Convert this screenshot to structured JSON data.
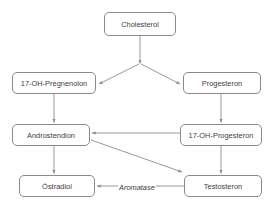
{
  "diagram": {
    "background_color": "#ffffff",
    "node_border_color": "#8a8a8a",
    "node_text_color": "#404040",
    "edge_color": "#8c8c8c",
    "nodes": [
      {
        "id": "cholesterol",
        "label": "Cholesterol",
        "x": 104,
        "y": 12,
        "w": 72,
        "h": 24
      },
      {
        "id": "pregnenolon_17oh",
        "label": "17-OH-Pregnenolon",
        "x": 12,
        "y": 72,
        "w": 84,
        "h": 22
      },
      {
        "id": "progesteron",
        "label": "Progesteron",
        "x": 183,
        "y": 72,
        "w": 78,
        "h": 22
      },
      {
        "id": "androstendion",
        "label": "Androstendion",
        "x": 12,
        "y": 124,
        "w": 78,
        "h": 22
      },
      {
        "id": "progesteron_17oh",
        "label": "17-OH-Progesteron",
        "x": 180,
        "y": 124,
        "w": 82,
        "h": 22
      },
      {
        "id": "oestradiol",
        "label": "Östradiol",
        "x": 19,
        "y": 175,
        "w": 76,
        "h": 22
      },
      {
        "id": "testosteron",
        "label": "Testosteron",
        "x": 184,
        "y": 175,
        "w": 78,
        "h": 22
      }
    ],
    "edges": [
      {
        "id": "cholesterol-junction",
        "from": "cholesterol",
        "to": "junction",
        "label": ""
      },
      {
        "id": "junction-to-pregnenolon",
        "from": "junction",
        "to": "pregnenolon_17oh",
        "label": ""
      },
      {
        "id": "junction-to-progesteron",
        "from": "junction",
        "to": "progesteron",
        "label": ""
      },
      {
        "id": "pregnenolon-to-androstendion",
        "from": "pregnenolon_17oh",
        "to": "androstendion",
        "label": ""
      },
      {
        "id": "progesteron-to-17oh-progesteron",
        "from": "progesteron",
        "to": "progesteron_17oh",
        "label": ""
      },
      {
        "id": "17oh-progesteron-to-androstendion",
        "from": "progesteron_17oh",
        "to": "androstendion",
        "label": ""
      },
      {
        "id": "17oh-progesteron-to-testosteron",
        "from": "progesteron_17oh",
        "to": "testosteron",
        "label": ""
      },
      {
        "id": "androstendion-to-oestradiol",
        "from": "androstendion",
        "to": "oestradiol",
        "label": ""
      },
      {
        "id": "androstendion-to-testosteron",
        "from": "androstendion",
        "to": "testosteron",
        "label": ""
      },
      {
        "id": "testosteron-to-oestradiol",
        "from": "testosteron",
        "to": "oestradiol",
        "label": "Aromatase"
      }
    ],
    "labels": [
      {
        "id": "aromatase",
        "text": "Aromatase",
        "x": 118,
        "y": 183
      }
    ]
  }
}
